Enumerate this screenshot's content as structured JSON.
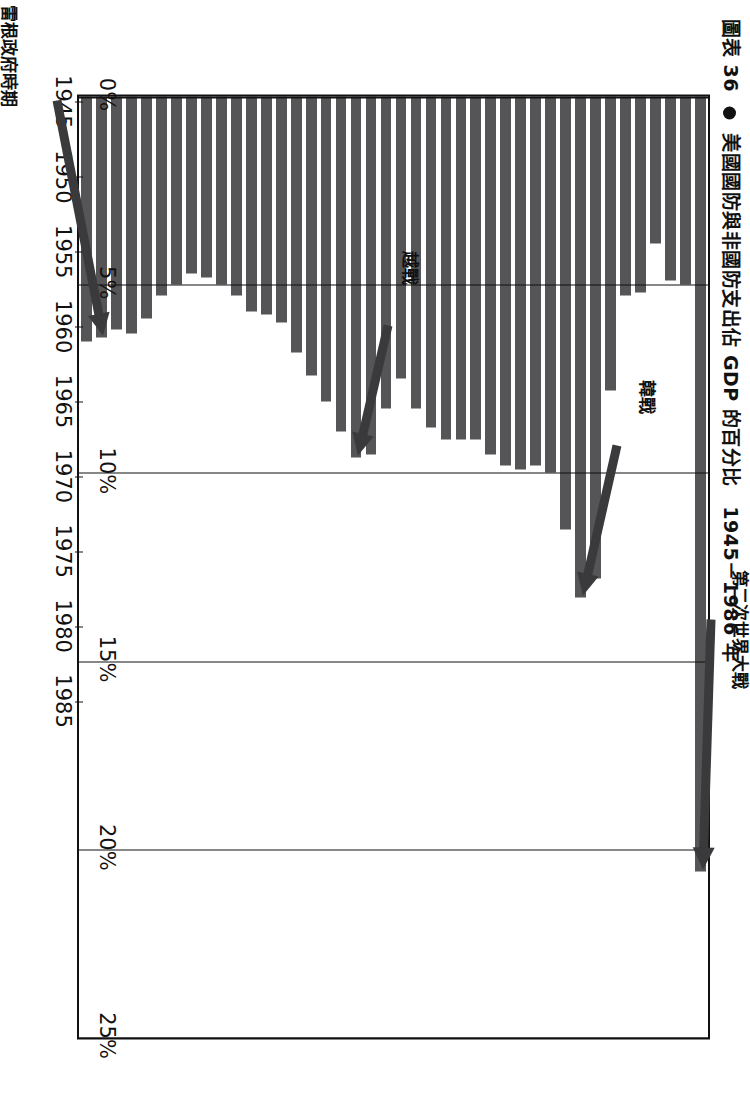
{
  "figure": {
    "title_prefix": "圖表 36",
    "title": "美國國防與非國防支出佔 GDP 的百分比　1945－1986 年",
    "bullet_icon": "bullet-icon"
  },
  "chart_data": {
    "type": "bar",
    "orientation": "horizontal-rotated",
    "title": "美國國防與非國防支出佔 GDP 的百分比　1945－1986 年",
    "xlabel": "",
    "ylabel": "",
    "ylim": [
      0,
      25
    ],
    "ytick_labels": [
      "0%",
      "5%",
      "10%",
      "15%",
      "20%",
      "25%"
    ],
    "ytick_values": [
      0,
      5,
      10,
      15,
      20,
      25
    ],
    "xtick_labels": [
      "1945",
      "1950",
      "1955",
      "1960",
      "1965",
      "1970",
      "1975",
      "1980",
      "1985"
    ],
    "xtick_values": [
      1945,
      1950,
      1955,
      1960,
      1965,
      1970,
      1975,
      1980,
      1985
    ],
    "grid": true,
    "legend": "none",
    "bar_color": "#555456",
    "categories": [
      1945,
      1946,
      1947,
      1948,
      1949,
      1950,
      1951,
      1952,
      1953,
      1954,
      1955,
      1956,
      1957,
      1958,
      1959,
      1960,
      1961,
      1962,
      1963,
      1964,
      1965,
      1966,
      1967,
      1968,
      1969,
      1970,
      1971,
      1972,
      1973,
      1974,
      1975,
      1976,
      1977,
      1978,
      1979,
      1980,
      1981,
      1982,
      1983,
      1984,
      1985,
      1986
    ],
    "values": [
      20.6,
      5.0,
      4.9,
      3.9,
      5.2,
      5.3,
      7.8,
      12.8,
      13.3,
      11.5,
      10.0,
      9.8,
      9.9,
      9.8,
      9.5,
      9.1,
      9.1,
      9.1,
      8.8,
      8.3,
      7.5,
      8.3,
      9.5,
      9.6,
      8.9,
      8.1,
      7.4,
      6.8,
      6.0,
      5.8,
      5.7,
      5.3,
      5.0,
      4.8,
      4.7,
      5.0,
      5.3,
      5.9,
      6.3,
      6.2,
      6.4,
      6.5
    ],
    "annotations": [
      {
        "label": "第二次世界大戰",
        "year": 1945,
        "value": 20.6
      },
      {
        "label": "韓戰",
        "year": 1953,
        "value": 13.3
      },
      {
        "label": "越戰",
        "year": 1968,
        "value": 9.6
      },
      {
        "label": "雷根政府時期",
        "year": 1985,
        "value": 6.4
      }
    ]
  },
  "source": ""
}
